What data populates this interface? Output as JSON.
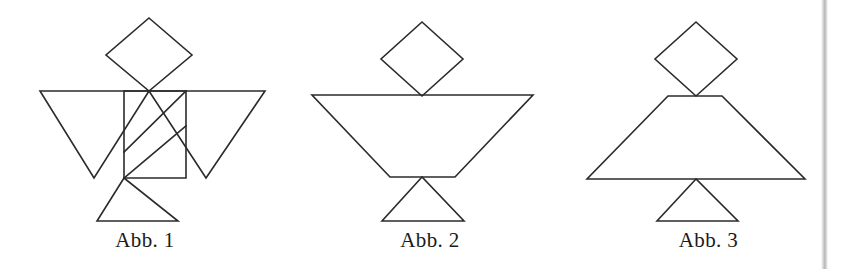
{
  "page": {
    "width": 847,
    "height": 269,
    "background_color": "#ffffff",
    "stroke_color": "#2b2b2b",
    "caption_color": "#1a1a1a",
    "scan_artifact": {
      "name": "vertical-gray-scan-band",
      "x": 821,
      "width": 7,
      "color": "#9a9a9a"
    }
  },
  "figures": [
    {
      "id": "fig1",
      "caption": "Abb. 1",
      "description": "Tangram bird: diamond head, two large wing triangles, center square with two parallel diagonal lines, bottom triangle base",
      "shapes": {
        "diamond": {
          "cx": 149,
          "top_y": 18,
          "right_x": 192,
          "bottom_y": 91,
          "left_x": 106
        },
        "left_wing": {
          "points": "40,91 149,91 94,178"
        },
        "right_wing": {
          "points": "265,91 149,91 206,178"
        },
        "square": {
          "points": "124,91 186,91 186,178 124,178"
        },
        "diagonal_1": {
          "points": "124,152 186,91"
        },
        "diagonal_2": {
          "points": "124,178 186,126"
        },
        "base_triangle": {
          "points": "124,178 97,221 178,221"
        }
      }
    },
    {
      "id": "fig2",
      "caption": "Abb. 2",
      "description": "Tangram goblet: diamond head, wide inverted trapezoid bowl, bottom triangle base",
      "shapes": {
        "diamond": {
          "cx": 422,
          "top_y": 22,
          "right_x": 463,
          "bottom_y": 96,
          "left_x": 381
        },
        "trapezoid": {
          "points": "312,95 533,95 455,177 390,177"
        },
        "base_triangle": {
          "points": "422,177 382,221 464,221"
        }
      }
    },
    {
      "id": "fig3",
      "caption": "Abb. 3",
      "description": "Tangram tree: diamond head, wide upright trapezoid body, bottom triangle base",
      "shapes": {
        "diamond": {
          "cx": 696,
          "top_y": 22,
          "right_x": 737,
          "bottom_y": 96,
          "left_x": 655
        },
        "trapezoid": {
          "points": "668,96 722,96 805,179 587,179"
        },
        "base_triangle": {
          "points": "696,179 657,221 738,221"
        }
      }
    }
  ]
}
